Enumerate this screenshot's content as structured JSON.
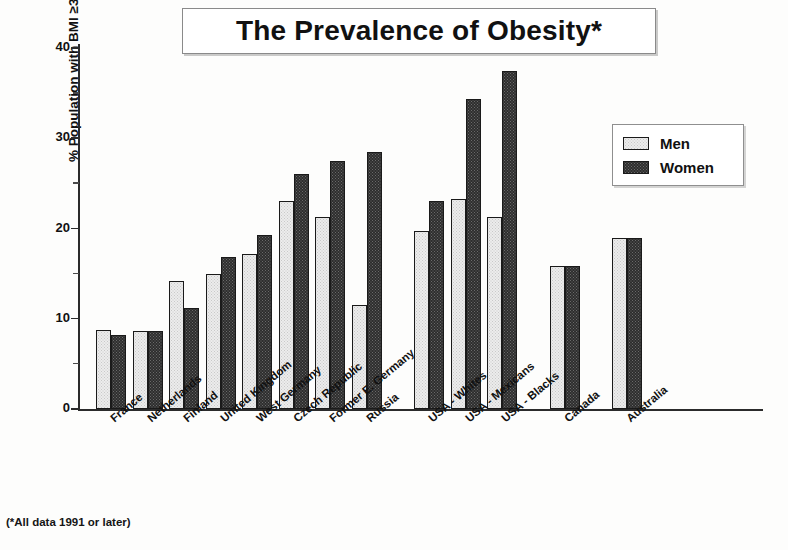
{
  "title": "The Prevalence of Obesity*",
  "footnote": "(*All data 1991 or later)",
  "legend": {
    "men_label": "Men",
    "women_label": "Women"
  },
  "colors": {
    "men": "#ececec",
    "women": "#2e2e2e",
    "axis": "#2b2b2b",
    "text": "#111111"
  },
  "chart_data": {
    "type": "bar",
    "title": "The Prevalence of Obesity*",
    "xlabel": "",
    "ylabel": "% Population with BMI ≥30",
    "ylabel_line1": "% Population with BMI",
    "ylabel_line2": "≥30",
    "ylim": [
      0,
      40
    ],
    "yticks": [
      0,
      10,
      20,
      30,
      40
    ],
    "yticklabels": [
      "0",
      "10",
      "20",
      "30",
      "40"
    ],
    "yminorticks": [
      5,
      15,
      25,
      35
    ],
    "grid": false,
    "legend_position": "upper right",
    "categories": [
      "France",
      "Netherlands",
      "Finland",
      "United Kingdom",
      "West Germany",
      "Czech Republic",
      "Former E. Germany",
      "Russia",
      "USA - Whites",
      "USA - Mexicans",
      "USA - Blacks",
      "Canada",
      "Australia"
    ],
    "series": [
      {
        "name": "Men",
        "values": [
          8.7,
          8.6,
          14.2,
          15.0,
          17.2,
          23.0,
          21.3,
          11.5,
          19.7,
          23.3,
          21.3,
          15.8,
          19.0
        ]
      },
      {
        "name": "Women",
        "values": [
          8.2,
          8.6,
          11.2,
          16.8,
          19.3,
          26.0,
          27.5,
          28.5,
          23.0,
          34.3,
          37.5,
          15.8,
          19.0
        ]
      }
    ],
    "group_gaps_after": [
      "Russia",
      "USA - Blacks",
      "Canada"
    ]
  }
}
